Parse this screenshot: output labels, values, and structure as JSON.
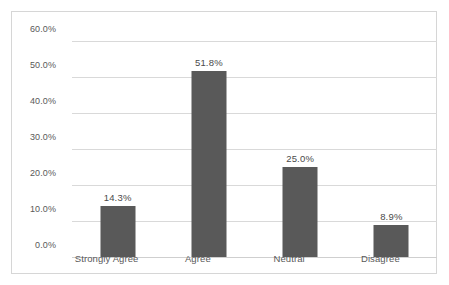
{
  "chart_data": {
    "type": "bar",
    "title": "",
    "subtitle": "",
    "xlabel": "",
    "ylabel": "",
    "categories": [
      "Strongly Agree",
      "Agree",
      "Neutral",
      "Disagree"
    ],
    "values": [
      14.3,
      51.8,
      25.0,
      8.9
    ],
    "data_labels": [
      "14.3%",
      "51.8%",
      "25.0%",
      "8.9%"
    ],
    "ylim": [
      0,
      60
    ],
    "ytick_values": [
      0,
      10,
      20,
      30,
      40,
      50,
      60
    ],
    "ytick_labels": [
      "0.0%",
      "10.0%",
      "20.0%",
      "30.0%",
      "40.0%",
      "50.0%",
      "60.0%"
    ],
    "grid": true,
    "grid_axis": "y",
    "legend": false,
    "legend_position": "none",
    "series": [
      {
        "name": "",
        "values": [
          14.3,
          51.8,
          25.0,
          8.9
        ]
      }
    ],
    "colors": {
      "bar_fill": "#595959",
      "gridline": "#d9d9d9",
      "axis_line": "#cfcfcf",
      "tick_text": "#595959",
      "label_text": "#4a4a4a",
      "frame_border": "#d6d6d6",
      "background": "#ffffff"
    }
  }
}
